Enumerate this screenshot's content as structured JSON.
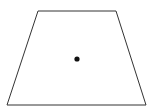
{
  "diagram": {
    "shape": "trapezoid",
    "vertices": [
      [
        38,
        11
      ],
      [
        116,
        11
      ],
      [
        146,
        105
      ],
      [
        7,
        105
      ]
    ],
    "stroke_color": "#333333",
    "fill_color": "#ffffff",
    "center_point": {
      "x": 77,
      "y": 59,
      "r": 2.6,
      "color": "#111111"
    }
  }
}
